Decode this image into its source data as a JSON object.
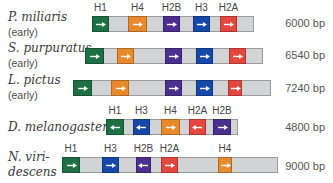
{
  "colors": {
    "H1": "#1f6f45",
    "H4": "#e8892b",
    "H2B": "#4b2e8e",
    "H3": "#1548a8",
    "H2A": "#e4473f",
    "spacer": "#d2d3d5"
  },
  "rows": [
    {
      "species": "P. miliaris",
      "sub": "(early)",
      "size": "6000 bp",
      "bar": {
        "x": 92,
        "y": 16,
        "w": 162
      },
      "genes": [
        {
          "name": "H1",
          "x": 92,
          "w": 17,
          "dir": "right",
          "show_label": true
        },
        {
          "name": "H4",
          "x": 128,
          "w": 19,
          "dir": "right",
          "show_label": true
        },
        {
          "name": "H2B",
          "x": 163,
          "w": 17,
          "dir": "right",
          "show_label": true
        },
        {
          "name": "H3",
          "x": 193,
          "w": 17,
          "dir": "right",
          "show_label": true
        },
        {
          "name": "H2A",
          "x": 220,
          "w": 17,
          "dir": "right",
          "show_label": true
        }
      ]
    },
    {
      "species": "S. purpuratus",
      "sub": "(early)",
      "size": "6540 bp",
      "bar": {
        "x": 85,
        "y": 48,
        "w": 178
      },
      "genes": [
        {
          "name": "H1",
          "x": 85,
          "w": 19,
          "dir": "right",
          "show_label": false
        },
        {
          "name": "H4",
          "x": 117,
          "w": 17,
          "dir": "right",
          "show_label": false
        },
        {
          "name": "H2B",
          "x": 165,
          "w": 17,
          "dir": "right",
          "show_label": false
        },
        {
          "name": "H3",
          "x": 196,
          "w": 17,
          "dir": "right",
          "show_label": false
        },
        {
          "name": "H2A",
          "x": 229,
          "w": 17,
          "dir": "right",
          "show_label": false
        }
      ]
    },
    {
      "species": "L. pictus",
      "sub": "(early)",
      "size": "7240 bp",
      "bar": {
        "x": 73,
        "y": 80,
        "w": 198
      },
      "genes": [
        {
          "name": "H1",
          "x": 73,
          "w": 19,
          "dir": "right",
          "show_label": false
        },
        {
          "name": "H4",
          "x": 111,
          "w": 18,
          "dir": "right",
          "show_label": false
        },
        {
          "name": "H2B",
          "x": 165,
          "w": 17,
          "dir": "right",
          "show_label": false
        },
        {
          "name": "H3",
          "x": 196,
          "w": 17,
          "dir": "right",
          "show_label": false
        },
        {
          "name": "H2A",
          "x": 228,
          "w": 14,
          "dir": "right",
          "show_label": false
        }
      ]
    },
    {
      "species": "D. melanogaster",
      "sub": "",
      "size": "4800 bp",
      "bar": {
        "x": 106,
        "y": 119,
        "w": 132
      },
      "genes": [
        {
          "name": "H1",
          "x": 106,
          "w": 18,
          "dir": "left",
          "show_label": true
        },
        {
          "name": "H3",
          "x": 133,
          "w": 17,
          "dir": "left",
          "show_label": true
        },
        {
          "name": "H4",
          "x": 161,
          "w": 19,
          "dir": "right",
          "show_label": true
        },
        {
          "name": "H2A",
          "x": 189,
          "w": 17,
          "dir": "left",
          "show_label": true
        },
        {
          "name": "H2B",
          "x": 213,
          "w": 18,
          "dir": "right",
          "show_label": true
        }
      ]
    },
    {
      "species": "N. viri-",
      "species2": "descens",
      "sub": "",
      "size": "9000 bp",
      "bar": {
        "x": 62,
        "y": 157,
        "w": 216
      },
      "genes": [
        {
          "name": "H1",
          "x": 62,
          "w": 18,
          "dir": "right",
          "show_label": true
        },
        {
          "name": "H3",
          "x": 102,
          "w": 17,
          "dir": "right",
          "show_label": true
        },
        {
          "name": "H2B",
          "x": 136,
          "w": 15,
          "dir": "left",
          "show_label": true
        },
        {
          "name": "H2A",
          "x": 161,
          "w": 17,
          "dir": "right",
          "show_label": true
        },
        {
          "name": "H4",
          "x": 218,
          "w": 14,
          "dir": "right",
          "show_label": true
        }
      ]
    }
  ]
}
